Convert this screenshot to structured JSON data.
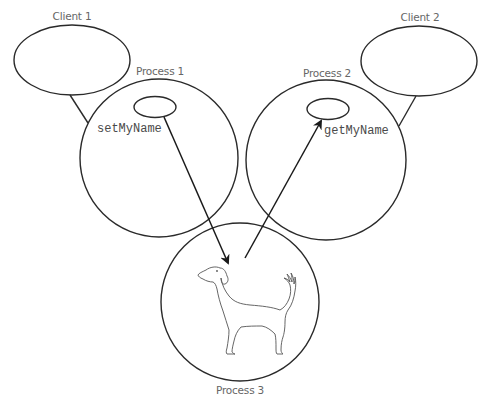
{
  "diagram": {
    "title": "",
    "nodes": {
      "client1": {
        "label": "Client 1",
        "shape": "ellipse"
      },
      "client2": {
        "label": "Client 2",
        "shape": "ellipse"
      },
      "process1": {
        "label": "Process 1",
        "shape": "circle",
        "method": "setMyName"
      },
      "process2": {
        "label": "Process 2",
        "shape": "circle",
        "method": "getMyName"
      },
      "process3": {
        "label": "Process 3",
        "shape": "circle",
        "content_icon": "dog-icon"
      }
    },
    "edges": [
      {
        "from": "client1",
        "to": "process1",
        "type": "line"
      },
      {
        "from": "client2",
        "to": "process2",
        "type": "line"
      },
      {
        "from": "process1.object",
        "to": "process3",
        "type": "arrow",
        "label": "setMyName"
      },
      {
        "from": "process3",
        "to": "process2.object",
        "type": "arrow",
        "label": "getMyName"
      }
    ],
    "colors": {
      "stroke": "#2a2a2a",
      "label": "#666666",
      "code": "#4a4a4a",
      "background": "#ffffff"
    }
  }
}
